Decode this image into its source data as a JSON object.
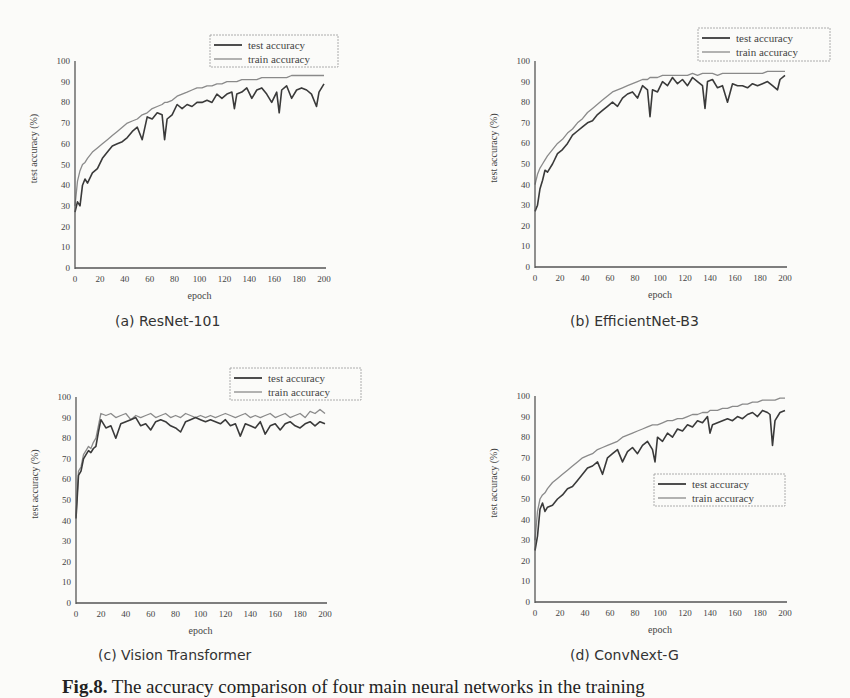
{
  "figure": {
    "caption_label": "Fig.8.",
    "caption_text": "The accuracy comparison of four main neural networks in the training"
  },
  "chart_data": [
    {
      "type": "line",
      "panel": "(a)",
      "title": "(a)  ResNet-101",
      "xlabel": "epoch",
      "ylabel": "test accuracy (%)",
      "xlim": [
        0,
        200
      ],
      "ylim": [
        0,
        100
      ],
      "xticks": [
        0,
        20,
        40,
        60,
        80,
        100,
        120,
        140,
        160,
        180,
        200
      ],
      "yticks": [
        0,
        10,
        20,
        30,
        40,
        50,
        60,
        70,
        80,
        90,
        100
      ],
      "legend": [
        "test accuracy",
        "train accuracy"
      ],
      "legend_position": "top-right",
      "x": [
        0,
        2,
        4,
        6,
        8,
        10,
        14,
        18,
        22,
        26,
        30,
        34,
        38,
        42,
        46,
        50,
        54,
        58,
        62,
        66,
        70,
        72,
        74,
        78,
        82,
        86,
        90,
        94,
        98,
        102,
        106,
        110,
        114,
        118,
        122,
        126,
        128,
        130,
        134,
        138,
        142,
        146,
        150,
        154,
        158,
        162,
        164,
        166,
        170,
        174,
        178,
        182,
        186,
        190,
        194,
        196,
        200
      ],
      "series": [
        {
          "name": "test accuracy",
          "color": "#3a3a3a",
          "values": [
            27,
            32,
            30,
            40,
            43,
            41,
            46,
            48,
            53,
            56,
            59,
            60,
            61,
            63,
            66,
            68,
            62,
            73,
            72,
            75,
            74,
            62,
            72,
            74,
            79,
            77,
            79,
            78,
            80,
            80,
            81,
            80,
            84,
            82,
            84,
            85,
            77,
            84,
            85,
            87,
            82,
            86,
            87,
            84,
            80,
            85,
            75,
            86,
            88,
            82,
            86,
            87,
            86,
            84,
            78,
            85,
            89
          ]
        },
        {
          "name": "train accuracy",
          "color": "#8a8a8a",
          "values": [
            30,
            42,
            47,
            50,
            51,
            53,
            56,
            58,
            60,
            62,
            64,
            66,
            68,
            70,
            71,
            72,
            74,
            75,
            77,
            78,
            79,
            80,
            80,
            81,
            83,
            84,
            85,
            86,
            87,
            87,
            88,
            88,
            89,
            89,
            90,
            90,
            90,
            90,
            91,
            91,
            91,
            91,
            92,
            92,
            92,
            92,
            92,
            92,
            92,
            93,
            93,
            93,
            93,
            93,
            93,
            93,
            93
          ]
        }
      ]
    },
    {
      "type": "line",
      "panel": "(b)",
      "title": "(b)  EfficientNet-B3",
      "xlabel": "epoch",
      "ylabel": "test accuracy (%)",
      "xlim": [
        0,
        200
      ],
      "ylim": [
        0,
        100
      ],
      "xticks": [
        0,
        20,
        40,
        60,
        80,
        100,
        120,
        140,
        160,
        180,
        200
      ],
      "yticks": [
        0,
        10,
        20,
        30,
        40,
        50,
        60,
        70,
        80,
        90,
        100
      ],
      "legend": [
        "test accuracy",
        "train accuracy"
      ],
      "legend_position": "top-right",
      "x": [
        0,
        2,
        4,
        6,
        8,
        10,
        14,
        18,
        22,
        26,
        30,
        34,
        38,
        42,
        46,
        50,
        54,
        58,
        62,
        66,
        70,
        74,
        78,
        82,
        86,
        90,
        92,
        94,
        98,
        102,
        106,
        110,
        114,
        118,
        122,
        126,
        130,
        134,
        136,
        138,
        142,
        146,
        150,
        154,
        158,
        162,
        166,
        170,
        174,
        178,
        182,
        186,
        190,
        194,
        196,
        200
      ],
      "series": [
        {
          "name": "test accuracy",
          "color": "#3a3a3a",
          "values": [
            27,
            30,
            38,
            42,
            47,
            46,
            50,
            55,
            57,
            60,
            64,
            66,
            68,
            70,
            71,
            74,
            76,
            78,
            80,
            78,
            82,
            84,
            85,
            82,
            88,
            86,
            73,
            86,
            85,
            90,
            88,
            92,
            89,
            91,
            88,
            92,
            90,
            88,
            77,
            90,
            91,
            87,
            88,
            80,
            89,
            88,
            88,
            87,
            89,
            88,
            89,
            90,
            88,
            86,
            91,
            93
          ]
        },
        {
          "name": "train accuracy",
          "color": "#8a8a8a",
          "values": [
            40,
            45,
            48,
            50,
            52,
            54,
            57,
            60,
            62,
            65,
            67,
            70,
            72,
            75,
            77,
            79,
            81,
            83,
            85,
            86,
            87,
            88,
            89,
            90,
            91,
            91,
            92,
            92,
            92,
            93,
            93,
            93,
            93,
            93,
            93,
            94,
            93,
            94,
            94,
            94,
            94,
            93,
            94,
            94,
            94,
            94,
            94,
            94,
            94,
            94,
            94,
            95,
            95,
            95,
            95,
            95
          ]
        }
      ]
    },
    {
      "type": "line",
      "panel": "(c)",
      "title": "(c)  Vision Transformer",
      "xlabel": "epoch",
      "ylabel": "test accuracy (%)",
      "xlim": [
        0,
        200
      ],
      "ylim": [
        0,
        100
      ],
      "xticks": [
        0,
        20,
        40,
        60,
        80,
        100,
        120,
        140,
        160,
        180,
        200
      ],
      "yticks": [
        0,
        10,
        20,
        30,
        40,
        50,
        60,
        70,
        80,
        90,
        100
      ],
      "legend": [
        "test accuracy",
        "train accuracy"
      ],
      "legend_position": "top-right",
      "x": [
        0,
        2,
        4,
        6,
        8,
        10,
        12,
        14,
        16,
        18,
        20,
        24,
        28,
        32,
        36,
        40,
        44,
        48,
        52,
        56,
        60,
        64,
        68,
        72,
        76,
        80,
        84,
        88,
        92,
        96,
        100,
        104,
        108,
        112,
        116,
        120,
        124,
        128,
        132,
        136,
        140,
        144,
        148,
        152,
        156,
        160,
        164,
        168,
        172,
        176,
        180,
        184,
        188,
        192,
        196,
        200
      ],
      "series": [
        {
          "name": "test accuracy",
          "color": "#3a3a3a",
          "values": [
            41,
            62,
            64,
            70,
            72,
            74,
            73,
            75,
            76,
            83,
            89,
            85,
            86,
            80,
            87,
            88,
            89,
            90,
            86,
            87,
            84,
            88,
            89,
            88,
            86,
            85,
            83,
            88,
            89,
            90,
            89,
            88,
            89,
            88,
            87,
            89,
            86,
            87,
            81,
            87,
            86,
            85,
            88,
            82,
            86,
            87,
            84,
            87,
            88,
            86,
            85,
            87,
            88,
            86,
            88,
            87
          ]
        },
        {
          "name": "train accuracy",
          "color": "#8a8a8a",
          "values": [
            42,
            64,
            66,
            72,
            74,
            76,
            75,
            78,
            80,
            86,
            92,
            91,
            92,
            90,
            91,
            92,
            89,
            91,
            90,
            91,
            92,
            90,
            91,
            92,
            90,
            91,
            90,
            92,
            91,
            90,
            91,
            90,
            91,
            90,
            91,
            92,
            91,
            90,
            91,
            92,
            90,
            91,
            90,
            91,
            92,
            90,
            91,
            92,
            90,
            91,
            92,
            90,
            93,
            92,
            94,
            92
          ]
        }
      ]
    },
    {
      "type": "line",
      "panel": "(d)",
      "title": "(d)  ConvNext-G",
      "xlabel": "epoch",
      "ylabel": "test accuracy (%)",
      "xlim": [
        0,
        200
      ],
      "ylim": [
        0,
        100
      ],
      "xticks": [
        0,
        20,
        40,
        60,
        80,
        100,
        120,
        140,
        160,
        180,
        200
      ],
      "yticks": [
        0,
        10,
        20,
        30,
        40,
        50,
        60,
        70,
        80,
        90,
        100
      ],
      "legend": [
        "test accuracy",
        "train accuracy"
      ],
      "legend_position": "center-right",
      "x": [
        0,
        2,
        4,
        6,
        8,
        10,
        14,
        18,
        22,
        26,
        30,
        34,
        38,
        42,
        46,
        50,
        54,
        58,
        62,
        66,
        70,
        74,
        78,
        82,
        86,
        90,
        94,
        96,
        98,
        102,
        106,
        110,
        114,
        118,
        122,
        126,
        130,
        134,
        138,
        140,
        142,
        146,
        150,
        154,
        158,
        162,
        166,
        170,
        174,
        178,
        182,
        186,
        188,
        190,
        192,
        196,
        200
      ],
      "series": [
        {
          "name": "test accuracy",
          "color": "#3a3a3a",
          "values": [
            25,
            32,
            45,
            48,
            44,
            46,
            47,
            50,
            52,
            55,
            56,
            59,
            62,
            65,
            66,
            68,
            62,
            70,
            72,
            74,
            68,
            73,
            75,
            72,
            76,
            78,
            74,
            68,
            80,
            78,
            82,
            80,
            84,
            83,
            86,
            85,
            88,
            87,
            90,
            82,
            86,
            87,
            88,
            89,
            88,
            90,
            89,
            91,
            92,
            90,
            93,
            92,
            91,
            76,
            88,
            92,
            93
          ]
        },
        {
          "name": "train accuracy",
          "color": "#8a8a8a",
          "values": [
            30,
            44,
            50,
            52,
            53,
            55,
            58,
            60,
            62,
            64,
            66,
            68,
            70,
            71,
            72,
            74,
            75,
            76,
            77,
            78,
            80,
            81,
            82,
            83,
            84,
            85,
            86,
            86,
            86,
            87,
            88,
            88,
            89,
            89,
            90,
            91,
            91,
            92,
            92,
            93,
            93,
            93,
            94,
            94,
            95,
            95,
            96,
            96,
            97,
            97,
            98,
            98,
            98,
            98,
            98,
            99,
            99
          ]
        }
      ]
    }
  ]
}
